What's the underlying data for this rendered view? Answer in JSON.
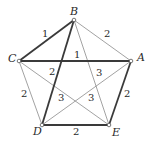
{
  "diagram": {
    "type": "weighted-complete-graph",
    "vertices": [
      {
        "id": "A",
        "label": "A",
        "x": 131,
        "y": 61,
        "lx": 137,
        "ly": 61
      },
      {
        "id": "B",
        "label": "B",
        "x": 74,
        "y": 20,
        "lx": 70,
        "ly": 15
      },
      {
        "id": "C",
        "label": "C",
        "x": 19,
        "y": 61,
        "lx": 8,
        "ly": 62
      },
      {
        "id": "D",
        "label": "D",
        "x": 42,
        "y": 125,
        "lx": 33,
        "ly": 135
      },
      {
        "id": "E",
        "label": "E",
        "x": 109,
        "y": 125,
        "lx": 112,
        "ly": 136
      }
    ],
    "edges": [
      {
        "from": "B",
        "to": "C",
        "weight": "1",
        "style": "bold",
        "lx": 42,
        "ly": 37
      },
      {
        "from": "C",
        "to": "A",
        "weight": "1",
        "style": "bold",
        "lx": 74,
        "ly": 58
      },
      {
        "from": "B",
        "to": "A",
        "weight": "2",
        "style": "thin",
        "lx": 104,
        "ly": 37
      },
      {
        "from": "B",
        "to": "D",
        "weight": "2",
        "style": "bold",
        "lx": 49,
        "ly": 75
      },
      {
        "from": "B",
        "to": "E",
        "weight": "3",
        "style": "thin",
        "lx": 96,
        "ly": 76
      },
      {
        "from": "C",
        "to": "D",
        "weight": "2",
        "style": "thin",
        "lx": 21,
        "ly": 97
      },
      {
        "from": "C",
        "to": "E",
        "weight": "3",
        "style": "thin",
        "lx": 58,
        "ly": 101
      },
      {
        "from": "A",
        "to": "D",
        "weight": "3",
        "style": "thin",
        "lx": 88,
        "ly": 101
      },
      {
        "from": "A",
        "to": "E",
        "weight": "2",
        "style": "bold",
        "lx": 124,
        "ly": 97
      },
      {
        "from": "D",
        "to": "E",
        "weight": "2",
        "style": "bold",
        "lx": 73,
        "ly": 135
      }
    ]
  }
}
